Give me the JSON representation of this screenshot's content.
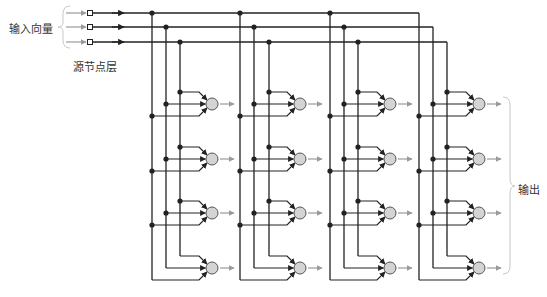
{
  "labels": {
    "input_vector": "输入向量",
    "source_layer": "源节点层",
    "output": "输出"
  },
  "colors": {
    "wire": "#222222",
    "grey_arrow": "#9a9a9a",
    "node_fill": "#d4d4d4",
    "node_stroke": "#555555",
    "brace": "#c8c8c8"
  },
  "layout": {
    "input_rows_y": [
      13,
      27,
      42
    ],
    "source_x": 90,
    "group_columns": [
      [
        152,
        166,
        180
      ],
      [
        240,
        254,
        269
      ],
      [
        330,
        344,
        358
      ],
      [
        419,
        433,
        447
      ]
    ],
    "node_rows_y": [
      104,
      159,
      213,
      268
    ],
    "node_offset_x": 60,
    "node_radius": 6
  },
  "structure": {
    "inputs": 3,
    "output_groups": 4,
    "neurons_per_group": 4,
    "description": "Single-layer feedforward network: 3 source nodes fully connected to 16 output neurons"
  }
}
